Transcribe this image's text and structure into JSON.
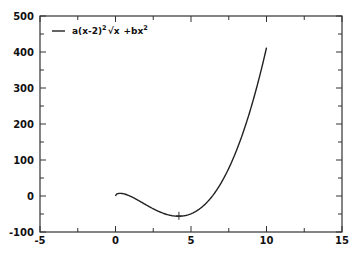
{
  "chart_data": {
    "type": "line",
    "title": "",
    "xlabel": "",
    "ylabel": "",
    "xlim": [
      -5,
      15
    ],
    "ylim": [
      -100,
      500
    ],
    "x_ticks": [
      -5,
      0,
      5,
      10,
      15
    ],
    "y_ticks": [
      -100,
      0,
      100,
      200,
      300,
      400,
      500
    ],
    "grid": false,
    "legend_position": "top-left",
    "series": [
      {
        "name": "a(x-2)^2·√x +bx^2",
        "color": "#000000",
        "params": {
          "a": 5,
          "b": -6
        },
        "x": [
          0,
          0.4,
          1,
          2,
          3,
          4,
          4.3,
          5,
          6,
          7,
          8,
          9,
          10
        ],
        "y": [
          0,
          7,
          -1,
          -24,
          -45,
          -57,
          -58,
          -49,
          -6,
          76,
          201,
          367,
          412
        ]
      }
    ],
    "annotations": [
      {
        "type": "marker",
        "shape": "plus",
        "x": 4.2,
        "y": -55
      }
    ]
  },
  "legend": {
    "entry_base": "a(x-2)",
    "entry_exp": "2",
    "entry_sqrt": "√x",
    "entry_plus": "+bx",
    "entry_exp2": "2"
  },
  "axis_labels": {
    "y": [
      "500",
      "400",
      "300",
      "200",
      "100",
      "0",
      "-100"
    ],
    "x": [
      "-5",
      "0",
      "5",
      "10",
      "15"
    ]
  }
}
